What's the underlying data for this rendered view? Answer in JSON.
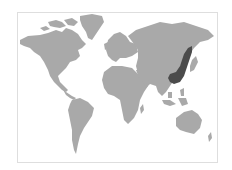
{
  "map": {
    "type": "world-choropleth",
    "colors": {
      "background": "#ffffff",
      "frame_border": "#dedede",
      "land": "#a9a9a9",
      "highlight": "#4b4b4b"
    },
    "highlighted_region": "East Asia (Northeast China / Manchuria to eastern China coast)",
    "continents": [
      "North America",
      "Greenland",
      "South America",
      "Europe",
      "Africa",
      "Asia",
      "Australia"
    ]
  }
}
